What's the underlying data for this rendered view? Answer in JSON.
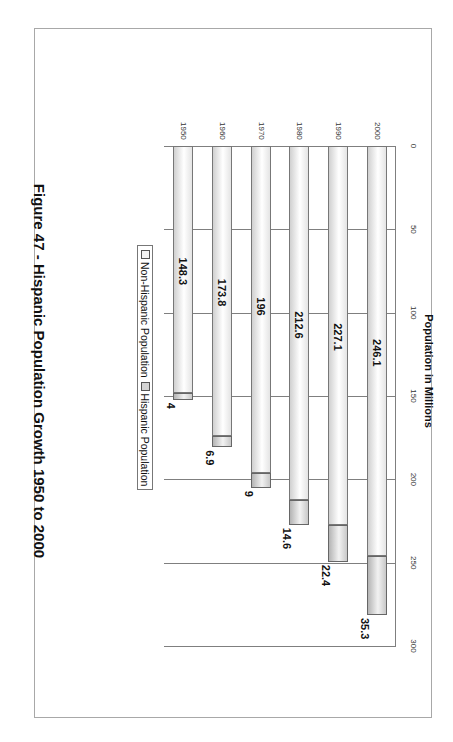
{
  "figure": {
    "caption": "Figure 47 - Hispanic Population Growth 1950 to 2000",
    "orientation": "rotated 90 degrees clockwise on page"
  },
  "legend": {
    "items": [
      {
        "label": "Non-Hispanic Population",
        "color": "#f0f0f0"
      },
      {
        "label": "Hispanic Population",
        "color": "#d4d4d4"
      }
    ]
  },
  "axis": {
    "title": "Population in Millions",
    "ticks": [
      "0",
      "50",
      "100",
      "150",
      "200",
      "250",
      "300"
    ]
  },
  "chart_data": {
    "type": "bar",
    "subtype": "stacked horizontal bar (3D cylinder style)",
    "title": "Figure 47 - Hispanic Population Growth 1950 to 2000",
    "xlabel": "Population in Millions",
    "ylabel": "",
    "xlim": [
      0,
      300
    ],
    "grid": true,
    "legend_position": "bottom",
    "categories": [
      "2000",
      "1990",
      "1980",
      "1970",
      "1960",
      "1950"
    ],
    "series": [
      {
        "name": "Non-Hispanic Population",
        "values": [
          246.1,
          227.1,
          212.6,
          196,
          173.8,
          148.3
        ]
      },
      {
        "name": "Hispanic Population",
        "values": [
          35.3,
          22.4,
          14.6,
          9,
          6.9,
          4
        ]
      }
    ],
    "data_labels": {
      "Non-Hispanic Population": [
        "246.1",
        "227.1",
        "212.6",
        "196",
        "173.8",
        "148.3"
      ],
      "Hispanic Population": [
        "35.3",
        "22.4",
        "14.6",
        "9",
        "6.9",
        "4"
      ]
    }
  }
}
